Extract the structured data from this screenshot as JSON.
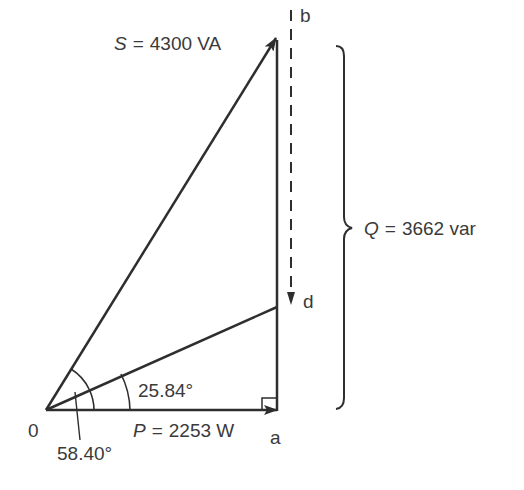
{
  "diagram": {
    "labels": {
      "apparent_power": {
        "symbol": "S",
        "eq": "=",
        "value": "4300 VA"
      },
      "reactive_power": {
        "symbol": "Q",
        "eq": "=",
        "value": "3662 var"
      },
      "real_power": {
        "symbol": "P",
        "eq": "=",
        "value": "2253 W"
      },
      "angle_inner": "25.84°",
      "angle_outer": "58.40°",
      "point_origin": "0",
      "point_a": "a",
      "point_b": "b",
      "point_d": "d"
    },
    "colors": {
      "line": "#2e2e2e",
      "text": "#3a3a3a",
      "background": "#ffffff"
    }
  }
}
